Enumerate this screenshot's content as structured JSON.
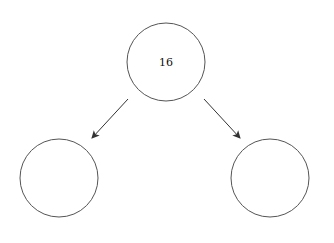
{
  "diagram": {
    "type": "binary-tree",
    "nodes": [
      {
        "id": "root",
        "label": "16",
        "cx": 166,
        "cy": 62,
        "r": 39
      },
      {
        "id": "left",
        "label": "",
        "cx": 59,
        "cy": 178,
        "r": 39
      },
      {
        "id": "right",
        "label": "",
        "cx": 270,
        "cy": 178,
        "r": 39
      }
    ],
    "edges": [
      {
        "from": "root",
        "to": "left"
      },
      {
        "from": "root",
        "to": "right"
      }
    ],
    "colors": {
      "stroke": "#555555",
      "arrow": "#333333",
      "background": "#ffffff"
    }
  }
}
